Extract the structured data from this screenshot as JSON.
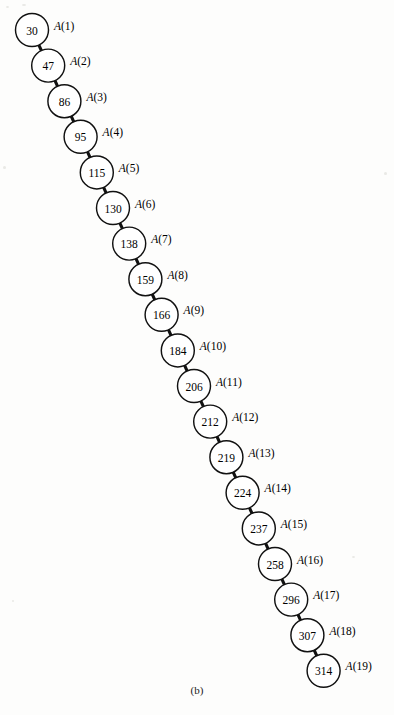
{
  "figure": {
    "caption": "(b)",
    "label_prefix": "A",
    "structure_type": "linked-list-chain",
    "colors": {
      "background": "#fdfdfc",
      "stroke": "#111111",
      "text": "#000000",
      "node_fill": "#ffffff"
    },
    "geometry": {
      "circle_radius": 16.5,
      "start_x": 32,
      "start_y": 30,
      "step_x": 16.2,
      "step_y": 35.6
    },
    "nodes": [
      {
        "index": 1,
        "value": "30",
        "label": "A(1)"
      },
      {
        "index": 2,
        "value": "47",
        "label": "A(2)"
      },
      {
        "index": 3,
        "value": "86",
        "label": "A(3)"
      },
      {
        "index": 4,
        "value": "95",
        "label": "A(4)"
      },
      {
        "index": 5,
        "value": "115",
        "label": "A(5)"
      },
      {
        "index": 6,
        "value": "130",
        "label": "A(6)"
      },
      {
        "index": 7,
        "value": "138",
        "label": "A(7)"
      },
      {
        "index": 8,
        "value": "159",
        "label": "A(8)"
      },
      {
        "index": 9,
        "value": "166",
        "label": "A(9)"
      },
      {
        "index": 10,
        "value": "184",
        "label": "A(10)"
      },
      {
        "index": 11,
        "value": "206",
        "label": "A(11)"
      },
      {
        "index": 12,
        "value": "212",
        "label": "A(12)"
      },
      {
        "index": 13,
        "value": "219",
        "label": "A(13)"
      },
      {
        "index": 14,
        "value": "224",
        "label": "A(14)"
      },
      {
        "index": 15,
        "value": "237",
        "label": "A(15)"
      },
      {
        "index": 16,
        "value": "258",
        "label": "A(16)"
      },
      {
        "index": 17,
        "value": "296",
        "label": "A(17)"
      },
      {
        "index": 18,
        "value": "307",
        "label": "A(18)"
      },
      {
        "index": 19,
        "value": "314",
        "label": "A(19)"
      }
    ]
  },
  "chart_data": {
    "type": "diagram",
    "title": "(b)",
    "categories": [
      "A(1)",
      "A(2)",
      "A(3)",
      "A(4)",
      "A(5)",
      "A(6)",
      "A(7)",
      "A(8)",
      "A(9)",
      "A(10)",
      "A(11)",
      "A(12)",
      "A(13)",
      "A(14)",
      "A(15)",
      "A(16)",
      "A(17)",
      "A(18)",
      "A(19)"
    ],
    "values": [
      30,
      47,
      86,
      95,
      115,
      130,
      138,
      159,
      166,
      184,
      206,
      212,
      219,
      224,
      237,
      258,
      296,
      307,
      314
    ],
    "xlabel": "",
    "ylabel": "",
    "legend": []
  }
}
